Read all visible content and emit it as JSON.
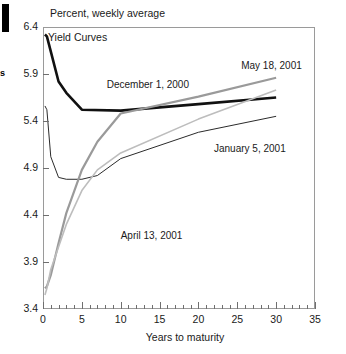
{
  "figure": {
    "edge_marker_name": "black-bar-marker",
    "edge_text": "s",
    "top_axis_note": "Percent, weekly average",
    "annotation_title": "Yield Curves"
  },
  "chart_data": {
    "type": "line",
    "title": "Yield Curves",
    "subtitle": "Percent, weekly average",
    "xlabel": "Years to maturity",
    "ylabel": "Percent, weekly average",
    "xlim": [
      0,
      35
    ],
    "ylim": [
      3.4,
      6.4
    ],
    "xticks": [
      0,
      5,
      10,
      15,
      20,
      25,
      30,
      35
    ],
    "xtick_labels": [
      "0",
      "5",
      "10",
      "15",
      "20",
      "25",
      "30",
      "35"
    ],
    "xminor_step": 1,
    "yticks": [
      3.4,
      3.9,
      4.4,
      4.9,
      5.4,
      5.9,
      6.4
    ],
    "ytick_labels": [
      "3.4",
      "3.9",
      "4.4",
      "4.9",
      "5.4",
      "5.9",
      "6.4"
    ],
    "grid": false,
    "legend": "inline-annotations",
    "series": [
      {
        "name": "December 1, 2000",
        "color": "#111111",
        "width": 2.6,
        "label_x": 8.2,
        "label_y": 5.78,
        "x": [
          0.25,
          0.5,
          1,
          2,
          3,
          5,
          10,
          20,
          30
        ],
        "y": [
          6.32,
          6.3,
          6.14,
          5.82,
          5.7,
          5.52,
          5.51,
          5.58,
          5.65
        ]
      },
      {
        "name": "January 5, 2001",
        "color": "#2b2b2b",
        "width": 1.0,
        "label_x": 22.0,
        "label_y": 5.1,
        "x": [
          0.25,
          0.5,
          1,
          2,
          3,
          5,
          7,
          10,
          20,
          30
        ],
        "y": [
          5.56,
          5.52,
          5.02,
          4.8,
          4.78,
          4.78,
          4.82,
          5.0,
          5.28,
          5.45
        ]
      },
      {
        "name": "April 13, 2001",
        "color": "#9a9a9a",
        "width": 2.2,
        "label_x": 10.0,
        "label_y": 4.18,
        "x": [
          0.25,
          0.5,
          1,
          2,
          3,
          5,
          7,
          10,
          20,
          30
        ],
        "y": [
          3.62,
          3.64,
          3.76,
          4.1,
          4.42,
          4.88,
          5.18,
          5.48,
          5.66,
          5.86
        ]
      },
      {
        "name": "May 18, 2001",
        "color": "#bdbdbd",
        "width": 1.6,
        "label_x": 25.5,
        "label_y": 5.98,
        "x": [
          0.25,
          0.5,
          1,
          2,
          3,
          5,
          7,
          10,
          20,
          30
        ],
        "y": [
          3.55,
          3.62,
          3.82,
          4.06,
          4.3,
          4.66,
          4.88,
          5.06,
          5.42,
          5.73
        ]
      }
    ]
  }
}
